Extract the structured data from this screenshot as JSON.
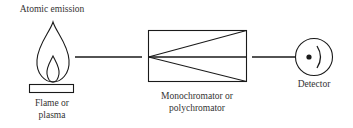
{
  "diagram": {
    "title": "Atomic emission",
    "components": {
      "source": {
        "label_line1": "Flame or",
        "label_line2": "plasma",
        "icon": "flame-icon"
      },
      "wavelength_selector": {
        "label_line1": "Monochromator or",
        "label_line2": "polychromator"
      },
      "detector": {
        "label": "Detector",
        "icon": "detector-icon"
      }
    },
    "colors": {
      "stroke": "#1a1a1a",
      "text": "#333333",
      "background": "#ffffff"
    }
  }
}
